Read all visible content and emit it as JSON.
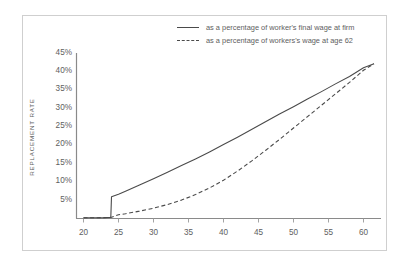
{
  "chart_data": {
    "type": "line",
    "title": "",
    "subtitle": "",
    "xlabel": "",
    "ylabel": "REPLACEMENT RATE",
    "xlim": [
      19,
      62.5
    ],
    "ylim": [
      0,
      45
    ],
    "grid": false,
    "legend_position": "top-right",
    "x_ticks": [
      "20",
      "25",
      "30",
      "35",
      "40",
      "45",
      "50",
      "55",
      "60"
    ],
    "x_tick_values": [
      20,
      25,
      30,
      35,
      40,
      45,
      50,
      55,
      60
    ],
    "y_ticks": [
      "5%",
      "10%",
      "15%",
      "20%",
      "25%",
      "30%",
      "35%",
      "40%",
      "45%"
    ],
    "y_tick_values": [
      5,
      10,
      15,
      20,
      25,
      30,
      35,
      40,
      45
    ],
    "series": [
      {
        "name": "as a percentage of worker's final wage at firm",
        "style": "solid",
        "color": "#4a4a4a",
        "x": [
          20,
          21,
          22,
          23,
          23.9,
          24.0,
          25,
          26,
          28,
          30,
          32,
          34,
          36,
          38,
          40,
          42,
          44,
          46,
          48,
          50,
          52,
          54,
          56,
          58,
          60,
          61.5
        ],
        "y": [
          0.2,
          0.2,
          0.2,
          0.2,
          0.3,
          5.9,
          6.6,
          7.4,
          9.1,
          10.8,
          12.6,
          14.4,
          16.2,
          18.1,
          20.1,
          22.1,
          24.2,
          26.3,
          28.4,
          30.4,
          32.5,
          34.5,
          36.6,
          38.6,
          41.0,
          42.1
        ]
      },
      {
        "name": "as a percentage of workers's wage at age 62",
        "style": "dashed",
        "color": "#4a4a4a",
        "x": [
          20,
          22,
          23.9,
          25,
          26,
          28,
          30,
          32,
          34,
          36,
          38,
          40,
          42,
          44,
          46,
          48,
          50,
          52,
          54,
          56,
          58,
          60,
          61.5
        ],
        "y": [
          0.2,
          0.2,
          0.3,
          1.0,
          1.3,
          2.0,
          2.8,
          3.8,
          5.0,
          6.5,
          8.3,
          10.4,
          12.9,
          15.6,
          18.5,
          21.5,
          24.6,
          27.7,
          30.8,
          33.9,
          37.0,
          40.3,
          42.1
        ]
      }
    ]
  },
  "legend": {
    "items": [
      {
        "label": "as a percentage of worker's final wage at firm",
        "style": "solid"
      },
      {
        "label": "as a percentage of workers's wage at age 62",
        "style": "dashed"
      }
    ]
  },
  "axes": {
    "y_title": "REPLACEMENT RATE"
  },
  "colors": {
    "line": "#4a4a4a",
    "axis": "#7a7a7a",
    "frame": "#cfcfcf",
    "text": "#5e5e5e",
    "background": "#ffffff"
  }
}
